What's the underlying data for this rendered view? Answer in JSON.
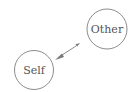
{
  "diagram": {
    "type": "relationship",
    "nodes": [
      {
        "id": "self",
        "label": "Self",
        "cx": 34,
        "cy": 70,
        "r": 19.5
      },
      {
        "id": "other",
        "label": "Other",
        "cx": 107,
        "cy": 29,
        "r": 20
      }
    ],
    "edges": [
      {
        "from": "other",
        "to": "self",
        "direction": "bidirectional",
        "x1": 79,
        "y1": 44,
        "x2": 56,
        "y2": 59
      }
    ],
    "colors": {
      "stroke": "#8c8c8c",
      "text": "#555555",
      "arrow": "#7a7a7a",
      "background": "#ffffff"
    }
  }
}
